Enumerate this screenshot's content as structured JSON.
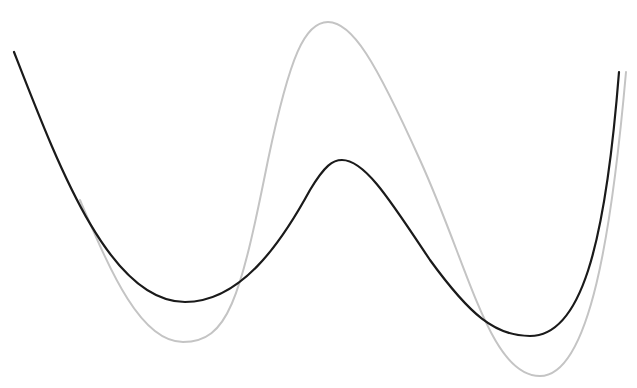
{
  "caption": {
    "text": ""
  },
  "diagram": {
    "background": "#ffffff",
    "curves": [
      {
        "name": "gray-curve",
        "color": "#c4c4c4",
        "stroke_width": 2,
        "path": "M 80 200 C 110 270, 140 342, 183 342 C 228 342, 240 300, 268 160 C 290 55, 305 22, 328 22 C 352 22, 375 60, 420 160 C 470 270, 490 376, 540 376 C 590 376, 612 230, 626 72"
      },
      {
        "name": "black-curve",
        "color": "#1a1a1a",
        "stroke_width": 2.2,
        "path": "M 14 52 C 60 170, 110 302, 185 302 C 240 302, 280 245, 310 190 C 325 165, 333 160, 342 160 C 365 160, 390 200, 430 260 C 470 315, 495 336, 530 336 C 580 336, 605 250, 619 72"
      }
    ]
  }
}
